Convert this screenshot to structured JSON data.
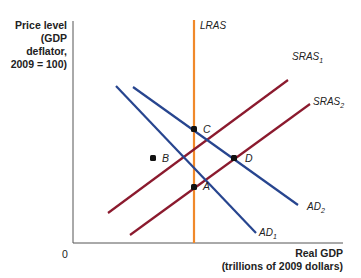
{
  "axes": {
    "y_label_lines": [
      "Price level",
      "(GDP",
      "deflator,",
      "2009 = 100)"
    ],
    "x_label_lines": [
      "Real GDP",
      "(trillions of 2009 dollars)"
    ],
    "origin": "0"
  },
  "colors": {
    "lras": "#f0892a",
    "sras": "#8b1a2e",
    "ad": "#27458f",
    "axis": "#555555",
    "point": "#111111"
  },
  "curves": {
    "lras": {
      "label": "LRAS",
      "sub": ""
    },
    "sras1": {
      "label": "SRAS",
      "sub": "1"
    },
    "sras2": {
      "label": "SRAS",
      "sub": "2"
    },
    "ad1": {
      "label": "AD",
      "sub": "1"
    },
    "ad2": {
      "label": "AD",
      "sub": "2"
    }
  },
  "points": {
    "a": "A",
    "b": "B",
    "c": "C",
    "d": "D"
  }
}
